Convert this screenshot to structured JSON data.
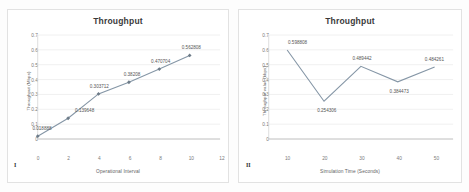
{
  "figures": [
    {
      "id": "figure-one",
      "caption": "I",
      "title": "Throughput",
      "chart_data": {
        "type": "line",
        "title": "Throughput",
        "xlabel": "Operational Interval",
        "ylabel": "Throughput (Mbps)",
        "x": [
          0,
          2,
          4,
          6,
          8,
          10
        ],
        "values": [
          0.018888,
          0.139648,
          0.303712,
          0.38208,
          0.470704,
          0.562808
        ],
        "point_labels": [
          "0.018888",
          "0.139648",
          "0.303712",
          "0.38208",
          "0.470704",
          "0.562808"
        ],
        "xticks": [
          "0",
          "2",
          "4",
          "6",
          "8",
          "10",
          "12"
        ],
        "yticks": [
          "0",
          "0.1",
          "0.2",
          "0.3",
          "0.4",
          "0.5",
          "0.6",
          "0.7"
        ],
        "xlim": [
          0,
          12
        ],
        "ylim": [
          0,
          0.7
        ],
        "grid": true,
        "legend": "none",
        "series_color": "#8596a6",
        "marker": "diamond"
      }
    },
    {
      "id": "figure-two",
      "caption": "II",
      "title": "Throughput",
      "chart_data": {
        "type": "line",
        "title": "Throughput",
        "xlabel": "Simulation Time (Seconds)",
        "ylabel": "Throughput value (kbps)",
        "x": [
          10,
          20,
          30,
          40,
          50
        ],
        "values": [
          0.598808,
          0.254306,
          0.489442,
          0.384473,
          0.484261
        ],
        "point_labels": [
          "0.598808",
          "0.254306",
          "0.489442",
          "0.384473",
          "0.484261"
        ],
        "xticks": [
          "10",
          "20",
          "30",
          "40",
          "50"
        ],
        "yticks": [
          "0",
          "0.1",
          "0.2",
          "0.3",
          "0.4",
          "0.5",
          "0.6",
          "0.7"
        ],
        "xlim": [
          5,
          55
        ],
        "ylim": [
          0,
          0.7
        ],
        "grid": true,
        "legend": "none",
        "series_color": "#8596a6",
        "marker": "none"
      }
    }
  ]
}
